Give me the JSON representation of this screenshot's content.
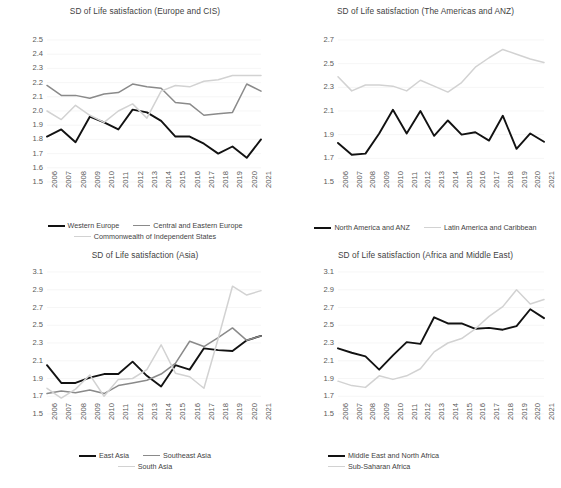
{
  "figure": {
    "background": "#ffffff",
    "series_colors": {
      "dark": "#121212",
      "medium": "#8a8a8a",
      "light": "#d2d2d2"
    },
    "shared_years": [
      "2006",
      "2007",
      "2008",
      "2009",
      "2010",
      "2011",
      "2012",
      "2013",
      "2014",
      "2015",
      "2016",
      "2017",
      "2018",
      "2019",
      "2020",
      "2021"
    ]
  },
  "chart_data": [
    {
      "id": "europe-cis",
      "type": "line",
      "title": "SD of Life satisfaction (Europe and CIS)",
      "xlabel": "",
      "ylabel": "",
      "ylim": [
        1.5,
        2.5
      ],
      "ytick_step": 0.1,
      "yticks": [
        "2.5",
        "2.4",
        "2.3",
        "2.2",
        "2.1",
        "2.0",
        "1.9",
        "1.8",
        "1.7",
        "1.6",
        "1.5"
      ],
      "grid": true,
      "legend_position": "bottom",
      "categories": [
        "2006",
        "2007",
        "2008",
        "2009",
        "2010",
        "2011",
        "2012",
        "2013",
        "2014",
        "2015",
        "2016",
        "2017",
        "2018",
        "2019",
        "2020",
        "2021"
      ],
      "series": [
        {
          "name": "Western Europe",
          "color": "#121212",
          "values": [
            1.82,
            1.87,
            1.78,
            1.96,
            1.92,
            1.87,
            2.01,
            1.99,
            1.93,
            1.82,
            1.82,
            1.77,
            1.7,
            1.75,
            1.67,
            1.8
          ]
        },
        {
          "name": "Central and Eastern Europe",
          "color": "#8a8a8a",
          "values": [
            2.18,
            2.11,
            2.11,
            2.09,
            2.12,
            2.13,
            2.19,
            2.17,
            2.16,
            2.06,
            2.05,
            1.97,
            1.98,
            1.99,
            2.19,
            2.14
          ]
        },
        {
          "name": "Commonwealth of Independent States",
          "color": "#d2d2d2",
          "values": [
            2.0,
            1.94,
            2.04,
            1.97,
            1.92,
            2.0,
            2.05,
            1.95,
            2.14,
            2.18,
            2.17,
            2.21,
            2.22,
            2.25,
            2.25,
            2.25
          ]
        }
      ]
    },
    {
      "id": "americas-anz",
      "type": "line",
      "title": "SD of Life satisfaction (The Americas and ANZ)",
      "xlabel": "",
      "ylabel": "",
      "ylim": [
        1.5,
        2.7
      ],
      "ytick_step": 0.2,
      "yticks": [
        "2.7",
        "2.5",
        "2.3",
        "2.1",
        "1.9",
        "1.7",
        "1.5"
      ],
      "grid": true,
      "legend_position": "bottom",
      "categories": [
        "2006",
        "2007",
        "2008",
        "2009",
        "2010",
        "2011",
        "2012",
        "2013",
        "2014",
        "2015",
        "2016",
        "2017",
        "2018",
        "2019",
        "2020",
        "2021"
      ],
      "series": [
        {
          "name": "North America and ANZ",
          "color": "#121212",
          "values": [
            1.83,
            1.73,
            1.74,
            1.91,
            2.11,
            1.91,
            2.1,
            1.89,
            2.02,
            1.9,
            1.92,
            1.85,
            2.06,
            1.78,
            1.91,
            1.84
          ]
        },
        {
          "name": "Latin America and Caribbean",
          "color": "#d2d2d2",
          "values": [
            2.39,
            2.27,
            2.32,
            2.32,
            2.31,
            2.27,
            2.36,
            2.31,
            2.26,
            2.34,
            2.47,
            2.55,
            2.62,
            2.58,
            2.54,
            2.51
          ]
        }
      ]
    },
    {
      "id": "asia",
      "type": "line",
      "title": "SD of Life satisfaction (Asia)",
      "xlabel": "",
      "ylabel": "",
      "ylim": [
        1.5,
        3.1
      ],
      "ytick_step": 0.2,
      "yticks": [
        "3.1",
        "2.9",
        "2.7",
        "2.5",
        "2.3",
        "2.1",
        "1.9",
        "1.7",
        "1.5"
      ],
      "grid": true,
      "legend_position": "bottom",
      "categories": [
        "2006",
        "2007",
        "2008",
        "2009",
        "2010",
        "2011",
        "2012",
        "2013",
        "2014",
        "2015",
        "2016",
        "2017",
        "2018",
        "2019",
        "2020",
        "2021"
      ],
      "series": [
        {
          "name": "East Asia",
          "color": "#121212",
          "values": [
            2.05,
            1.85,
            1.85,
            1.91,
            1.95,
            1.95,
            2.09,
            1.93,
            1.81,
            2.05,
            2.0,
            2.24,
            2.22,
            2.21,
            2.33,
            2.38
          ]
        },
        {
          "name": "Southeast Asia",
          "color": "#8a8a8a",
          "values": [
            1.73,
            1.76,
            1.74,
            1.77,
            1.73,
            1.82,
            1.85,
            1.88,
            1.95,
            2.07,
            2.32,
            2.26,
            2.36,
            2.47,
            2.33,
            2.38
          ]
        },
        {
          "name": "South Asia",
          "color": "#d2d2d2",
          "values": [
            1.79,
            1.68,
            1.78,
            1.94,
            1.7,
            1.89,
            1.9,
            2.0,
            2.28,
            1.96,
            1.92,
            1.79,
            2.35,
            2.94,
            2.84,
            2.89
          ]
        }
      ]
    },
    {
      "id": "africa-middle-east",
      "type": "line",
      "title": "SD of Life satisfaction (Africa and Middle East)",
      "xlabel": "",
      "ylabel": "",
      "ylim": [
        1.5,
        3.1
      ],
      "ytick_step": 0.2,
      "yticks": [
        "3.1",
        "2.9",
        "2.7",
        "2.5",
        "2.3",
        "2.1",
        "1.9",
        "1.7",
        "1.5"
      ],
      "grid": true,
      "legend_position": "bottom",
      "categories": [
        "2006",
        "2007",
        "2008",
        "2009",
        "2010",
        "2011",
        "2012",
        "2013",
        "2014",
        "2015",
        "2016",
        "2017",
        "2018",
        "2019",
        "2020",
        "2021"
      ],
      "series": [
        {
          "name": "Middle East and North Africa",
          "color": "#121212",
          "values": [
            2.24,
            2.19,
            2.15,
            2.0,
            2.16,
            2.31,
            2.29,
            2.59,
            2.52,
            2.52,
            2.46,
            2.47,
            2.45,
            2.49,
            2.68,
            2.58
          ]
        },
        {
          "name": "Sub-Saharan Africa",
          "color": "#d2d2d2",
          "values": [
            1.87,
            1.82,
            1.8,
            1.93,
            1.89,
            1.93,
            2.01,
            2.2,
            2.3,
            2.35,
            2.46,
            2.6,
            2.71,
            2.9,
            2.74,
            2.79
          ]
        }
      ]
    }
  ]
}
